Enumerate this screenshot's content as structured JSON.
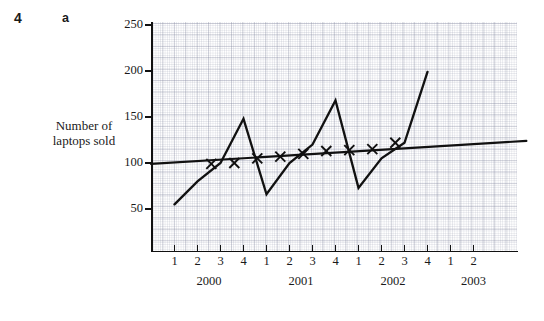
{
  "question": {
    "number": "4",
    "part": "a"
  },
  "axes": {
    "ylabel_line1": "Number of",
    "ylabel_line2": "laptops sold",
    "y_ticks": [
      "50",
      "100",
      "150",
      "200",
      "250"
    ],
    "x_quarter_labels": [
      "1",
      "2",
      "3",
      "4",
      "1",
      "2",
      "3",
      "4",
      "1",
      "2",
      "3",
      "4",
      "1",
      "2"
    ],
    "x_year_labels": [
      "2000",
      "2001",
      "2002",
      "2003"
    ]
  },
  "chart_data": {
    "type": "line",
    "title": "",
    "xlabel": "",
    "ylabel": "Number of laptops sold",
    "ylim": [
      0,
      250
    ],
    "yticks": [
      50,
      100,
      150,
      200,
      250
    ],
    "grid": true,
    "legend": "none",
    "x": [
      "2000 Q1",
      "2000 Q2",
      "2000 Q3",
      "2000 Q4",
      "2001 Q1",
      "2001 Q2",
      "2001 Q3",
      "2001 Q4",
      "2002 Q1",
      "2002 Q2",
      "2002 Q3",
      "2002 Q4"
    ],
    "series": [
      {
        "name": "Quarterly laptops sold",
        "style": "line",
        "values": [
          55,
          80,
          100,
          148,
          66,
          100,
          120,
          168,
          73,
          105,
          122,
          199
        ]
      },
      {
        "name": "Four-point moving average",
        "style": "x-markers",
        "x": [
          "2000 Q2.5",
          "2000 Q3.5",
          "2000 Q4.5",
          "2001 Q1.5",
          "2001 Q2.5",
          "2001 Q3.5",
          "2001 Q4.5",
          "2002 Q1.5",
          "2002 Q2.5"
        ],
        "values": [
          99,
          100,
          105,
          107,
          110,
          113,
          114,
          115,
          122
        ]
      },
      {
        "name": "Trend line",
        "style": "straight-line",
        "endpoints": [
          [
            "2000 Q1",
            99
          ],
          [
            "2002 Q4",
            124
          ]
        ]
      }
    ],
    "colors": {
      "line": "#111111",
      "grid": "#8a8fa8",
      "axis": "#111111"
    }
  }
}
